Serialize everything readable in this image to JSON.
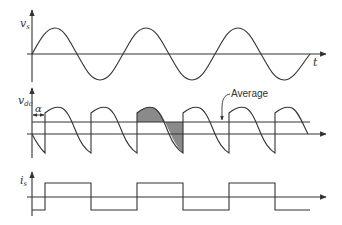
{
  "diagram": {
    "type": "waveform-diagram",
    "colors": {
      "line": "#333333",
      "shade": "#8a8a8a",
      "background": "#ffffff"
    },
    "plots": [
      {
        "id": "vs",
        "label_main": "v",
        "label_sub": "s",
        "time_label": "t",
        "description": "sinusoidal source voltage, ~3 cycles"
      },
      {
        "id": "vdc",
        "label_main": "v",
        "label_sub": "dc",
        "alpha_label": "α",
        "average_label": "Average",
        "description": "rectified output voltage with firing delay α; one segment shaded"
      },
      {
        "id": "is",
        "label_main": "i",
        "label_sub": "s",
        "description": "square-wave source current shifted by α"
      }
    ]
  }
}
